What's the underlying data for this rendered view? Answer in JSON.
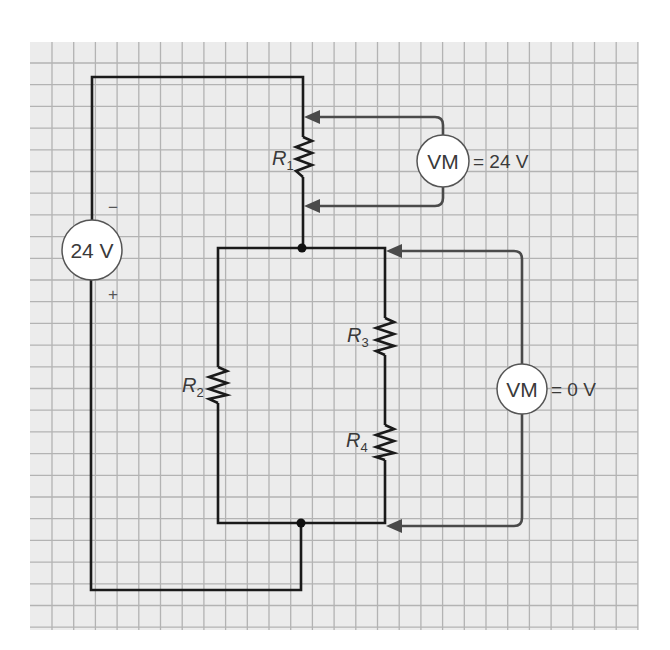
{
  "diagram": {
    "type": "series-parallel circuit with voltmeters",
    "colors": {
      "background": "#ffffff",
      "grid_fill": "#ececec",
      "grid_line": "#b3b3b3",
      "wire": "#1a1a1a",
      "meter_lead": "#4a4a4a",
      "text": "#3a3a3a"
    },
    "source": {
      "label": "24 V",
      "minus": "−",
      "plus": "+"
    },
    "resistors": [
      {
        "id": "R1",
        "letter": "R",
        "subscript": "1"
      },
      {
        "id": "R2",
        "letter": "R",
        "subscript": "2"
      },
      {
        "id": "R3",
        "letter": "R",
        "subscript": "3"
      },
      {
        "id": "R4",
        "letter": "R",
        "subscript": "4"
      }
    ],
    "voltmeters": [
      {
        "id": "VM1",
        "label": "VM",
        "reading": "= 24 V",
        "across": "R1"
      },
      {
        "id": "VM2",
        "label": "VM",
        "reading": "= 0 V",
        "across": "R3 + R4"
      }
    ],
    "junctions": 2
  }
}
